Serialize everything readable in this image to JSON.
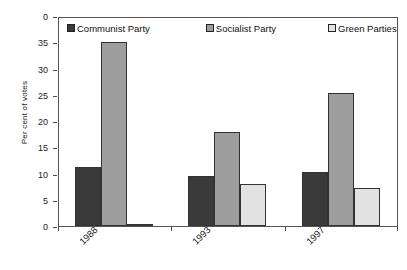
{
  "chart_data": {
    "type": "bar",
    "title": "",
    "subtitle": "",
    "xlabel": "",
    "ylabel": "Per cent of votes",
    "categories": [
      "1988",
      "1993",
      "1997"
    ],
    "series": [
      {
        "name": "Communist Party",
        "color": "#3a3a3a",
        "values": [
          11.3,
          9.5,
          10.2
        ]
      },
      {
        "name": "Socialist Party",
        "color": "#9e9e9e",
        "values": [
          35.0,
          18.0,
          25.3
        ]
      },
      {
        "name": "Green Parties",
        "color": "#e2e2e2",
        "values": [
          0.4,
          8.0,
          7.3
        ]
      }
    ],
    "ylim": [
      0,
      40
    ],
    "yticks": [
      40,
      35,
      30,
      25,
      20,
      15,
      10,
      5,
      0
    ],
    "ytick_labels": [
      "0",
      "35",
      "30",
      "25",
      "20",
      "15",
      "10",
      "5",
      "0"
    ],
    "grid": false,
    "legend_position": "top-inside",
    "xtick_label_rotation": -45
  },
  "legend": {
    "entries": [
      {
        "label": "Communist Party",
        "color": "#3a3a3a"
      },
      {
        "label": "Socialist Party",
        "color": "#9e9e9e"
      },
      {
        "label": "Green Parties",
        "color": "#e2e2e2"
      }
    ]
  },
  "axes": {
    "y_title": "Per cent of votes",
    "y_tick_labels": [
      "0",
      "35",
      "30",
      "25",
      "20",
      "15",
      "10",
      "5",
      "0"
    ],
    "x_tick_labels": [
      "1988",
      "1993",
      "1997"
    ]
  },
  "colors": {
    "communist": "#3a3a3a",
    "socialist": "#9e9e9e",
    "green": "#e2e2e2",
    "frame": "#555555",
    "text": "#1a1a1a"
  }
}
